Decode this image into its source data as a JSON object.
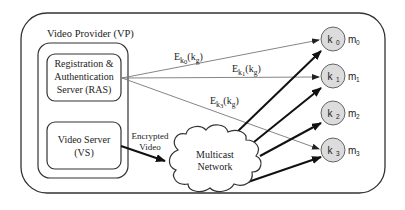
{
  "diagram": {
    "outer_box": {
      "label": "Video Provider (VP)"
    },
    "ras": {
      "lines": [
        "Registration &",
        "Authentication",
        "Server (RAS)"
      ]
    },
    "vs": {
      "lines": [
        "Video Server",
        "(VS)"
      ]
    },
    "encrypted_video": {
      "lines": [
        "Encrypted",
        "Video"
      ]
    },
    "cloud": {
      "lines": [
        "Multicast",
        "Network"
      ]
    },
    "edges": [
      {
        "E": "E",
        "sub": "k",
        "subsub": "0",
        "arg": "(k",
        "argsub": "g",
        "close": ")"
      },
      {
        "E": "E",
        "sub": "k",
        "subsub": "1",
        "arg": "(k",
        "argsub": "g",
        "close": ")"
      },
      {
        "E": "E",
        "sub": "k",
        "subsub": "3",
        "arg": "(k",
        "argsub": "g",
        "close": ")"
      }
    ],
    "nodes": [
      {
        "key": "k",
        "idx": "0",
        "member": "m",
        "midx": "0"
      },
      {
        "key": "k",
        "idx": "1",
        "member": "m",
        "midx": "1"
      },
      {
        "key": "k",
        "idx": "2",
        "member": "m",
        "midx": "2"
      },
      {
        "key": "k",
        "idx": "3",
        "member": "m",
        "midx": "3"
      }
    ],
    "colors": {
      "node_fill": "#dcdcdc",
      "stroke": "#333333",
      "thin_line": "#777777"
    }
  }
}
